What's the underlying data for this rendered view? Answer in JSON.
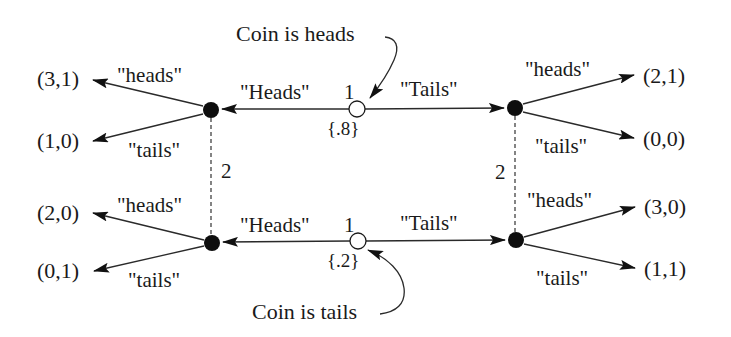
{
  "diagram": {
    "type": "game-tree",
    "colors": {
      "ink": "#1a1a1a",
      "background": "#ffffff"
    },
    "annotations": {
      "coin_heads": "Coin is heads",
      "coin_tails": "Coin is tails"
    },
    "top": {
      "chance_node": {
        "player_label": "1",
        "probability": "{.8}"
      },
      "left_move": "\"Heads\"",
      "right_move": "\"Tails\"",
      "left_info_set": {
        "player_label": "2",
        "heads_label": "\"heads\"",
        "tails_label": "\"tails\"",
        "payoff_heads": "(3,1)",
        "payoff_tails": "(1,0)"
      },
      "right_info_set": {
        "player_label": "2",
        "heads_label": "\"heads\"",
        "tails_label": "\"tails\"",
        "payoff_heads": "(2,1)",
        "payoff_tails": "(0,0)"
      }
    },
    "bottom": {
      "chance_node": {
        "player_label": "1",
        "probability": "{.2}"
      },
      "left_move": "\"Heads\"",
      "right_move": "\"Tails\"",
      "left_info_set": {
        "heads_label": "\"heads\"",
        "tails_label": "\"tails\"",
        "payoff_heads": "(2,0)",
        "payoff_tails": "(0,1)"
      },
      "right_info_set": {
        "heads_label": "\"heads\"",
        "tails_label": "\"tails\"",
        "payoff_heads": "(3,0)",
        "payoff_tails": "(1,1)"
      }
    }
  }
}
